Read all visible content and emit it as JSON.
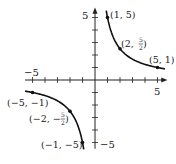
{
  "chart_data": {
    "type": "line",
    "title": "",
    "function": "y = 5/x",
    "xlabel": "",
    "ylabel": "",
    "xlim": [
      -5.5,
      5.6
    ],
    "ylim": [
      -5.5,
      5.6
    ],
    "grid": false,
    "axis_labels": {
      "x_neg": "−5",
      "x_pos": "5",
      "y_pos": "5",
      "y_neg": "−5"
    },
    "series": [
      {
        "name": "right-branch",
        "x_range": [
          0.9,
          5.6
        ]
      },
      {
        "name": "left-branch",
        "x_range": [
          -5.6,
          -0.9
        ]
      }
    ],
    "points": [
      {
        "x": 1,
        "y": 5,
        "label": "(1, 5)"
      },
      {
        "x": 2,
        "y": 2.5,
        "label_main": "(2, ",
        "label_num": "5",
        "label_den": "2",
        "label_close": ")"
      },
      {
        "x": 5,
        "y": 1,
        "label": "(5, 1)"
      },
      {
        "x": -5,
        "y": -1,
        "label": "(−5, −1)"
      },
      {
        "x": -2,
        "y": -2.5,
        "label_main": "(−2, −",
        "label_num": "5",
        "label_den": "2",
        "label_close": ")"
      },
      {
        "x": -1,
        "y": -5,
        "label": "(−1, −5)"
      }
    ]
  }
}
